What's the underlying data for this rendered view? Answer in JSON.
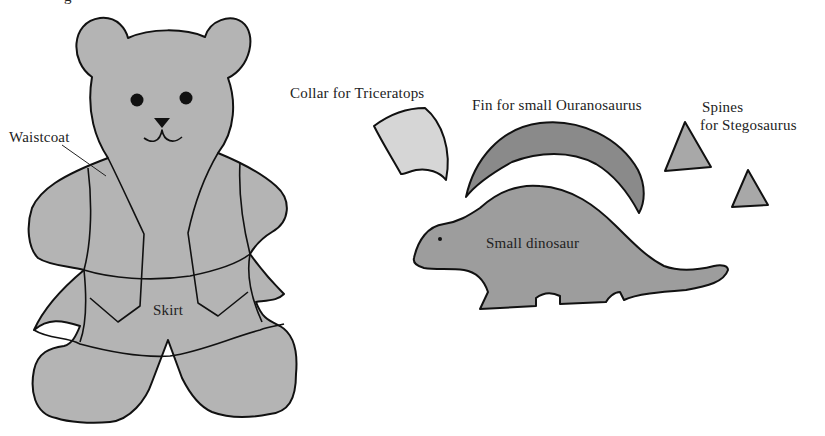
{
  "colors": {
    "background": "#ffffff",
    "outline": "#111111",
    "bear_fill": "#b4b4b4",
    "collar_fill": "#d6d6d6",
    "fin_fill": "#8a8a8a",
    "spine_fill": "#a8a8a8",
    "dinosaur_fill": "#9d9d9d"
  },
  "labels": {
    "top_cut": "g",
    "waistcoat": "Waistcoat",
    "skirt": "Skirt",
    "collar": "Collar for Triceratops",
    "fin": "Fin for small Ouranosaurus",
    "spines_line1": "Spines",
    "spines_line2": "for Stegosaurus",
    "dinosaur": "Small dinosaur"
  }
}
